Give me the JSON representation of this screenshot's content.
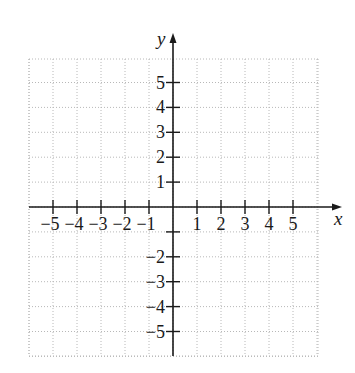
{
  "chart_data": {
    "type": "scatter",
    "title": "",
    "xlabel": "x",
    "ylabel": "y",
    "xlim": [
      -6,
      6
    ],
    "ylim": [
      -6,
      6
    ],
    "grid": true,
    "x_ticks": [
      -5,
      -4,
      -3,
      -2,
      -1,
      1,
      2,
      3,
      4,
      5
    ],
    "x_tick_labels": [
      "−5",
      "−4",
      "−3",
      "−2",
      "−1",
      "1",
      "2",
      "3",
      "4",
      "5"
    ],
    "y_ticks": [
      5,
      4,
      3,
      2,
      1,
      -1,
      -2,
      -3,
      -4,
      -5
    ],
    "y_tick_labels": [
      "5",
      "4",
      "3",
      "2",
      "1",
      "",
      "−2",
      "−3",
      "−4",
      "−5"
    ],
    "series": []
  },
  "geometry": {
    "origin_x": 173,
    "origin_y": 207,
    "unit_x": 24,
    "unit_y": 24.9,
    "grid_left": 29,
    "grid_right": 318,
    "grid_top": 59,
    "grid_bottom": 356,
    "x_axis_end": 342,
    "y_axis_top": 33,
    "y_axis_bottom": 356,
    "axis_color": "#1a1a1a",
    "grid_color": "#b8b8b8"
  }
}
